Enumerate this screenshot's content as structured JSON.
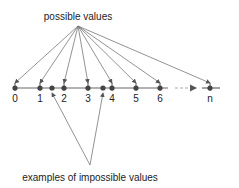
{
  "title_fragment": "",
  "top_label": "possible values",
  "bottom_label": "examples of impossible values",
  "number_line": {
    "possible_values": [
      "0",
      "1",
      "2",
      "3",
      "4",
      "5",
      "6",
      "n"
    ],
    "impossible_examples": [
      "between 1 and 2",
      "between 3 and 4"
    ]
  },
  "colors": {
    "line": "#666666",
    "point": "#444444",
    "text": "#222222",
    "arrow": "#777777"
  }
}
